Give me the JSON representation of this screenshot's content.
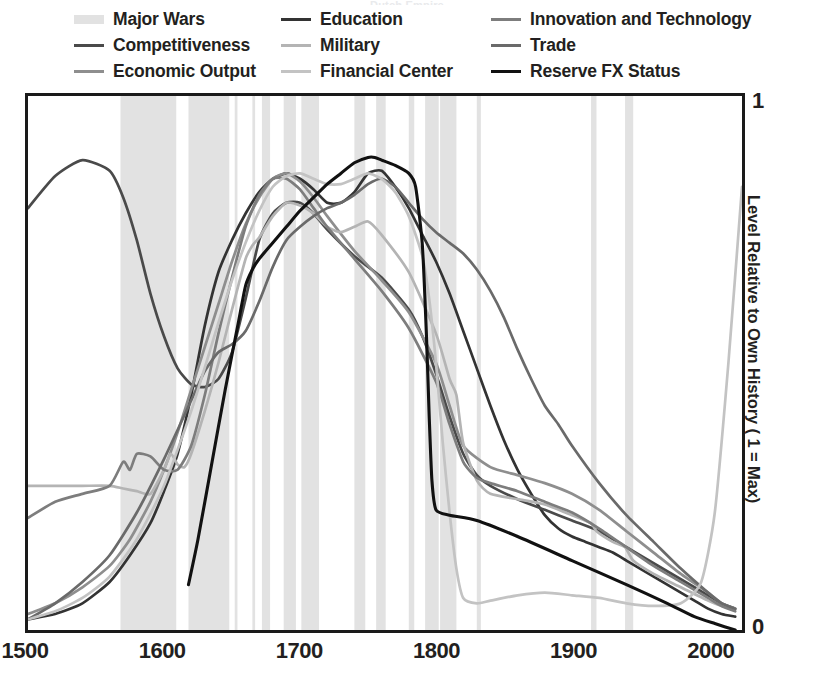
{
  "title_sliver": "Dutch Empire",
  "legend": {
    "columns": [
      {
        "items": [
          {
            "label": "Major Wars",
            "name": "major-wars",
            "color": "#e2e2e2",
            "style": "band"
          },
          {
            "label": "Competitiveness",
            "name": "competitiveness",
            "color": "#4a4a4a",
            "style": "line"
          },
          {
            "label": "Economic Output",
            "name": "economic-output",
            "color": "#8e8e8e",
            "style": "line"
          }
        ]
      },
      {
        "items": [
          {
            "label": "Education",
            "name": "education",
            "color": "#333333",
            "style": "line"
          },
          {
            "label": "Military",
            "name": "military",
            "color": "#b4b4b4",
            "style": "line"
          },
          {
            "label": "Financial Center",
            "name": "financial-center",
            "color": "#c3c3c3",
            "style": "line"
          }
        ]
      },
      {
        "items": [
          {
            "label": "Innovation and Technology",
            "name": "innovation-and-technology",
            "color": "#7d7d7d",
            "style": "line"
          },
          {
            "label": "Trade",
            "name": "trade",
            "color": "#6a6a6a",
            "style": "line"
          },
          {
            "label": "Reserve FX Status",
            "name": "reserve-fx-status",
            "color": "#111111",
            "style": "line"
          }
        ]
      }
    ]
  },
  "axes": {
    "x_ticks": [
      "1500",
      "1600",
      "1700",
      "1800",
      "1900",
      "2000"
    ],
    "y_tick_top": "1",
    "y_tick_bottom": "0",
    "y_label": "Level Relative to Own History ( 1 = Max)"
  },
  "chart_data": {
    "type": "line",
    "title": "Dutch Empire",
    "xlabel": "",
    "ylabel": "Level Relative to Own History ( 1 = Max)",
    "xlim": [
      1500,
      2025
    ],
    "ylim": [
      0,
      1
    ],
    "grid": false,
    "legend_position": "top",
    "xticks": [
      1500,
      1600,
      1700,
      1800,
      1900,
      2000
    ],
    "yticks": [
      0,
      1
    ],
    "shaded_bands": {
      "name": "Major Wars",
      "color": "#e2e2e2",
      "intervals": [
        [
          1568,
          1609
        ],
        [
          1618,
          1648
        ],
        [
          1652,
          1654
        ],
        [
          1665,
          1667
        ],
        [
          1672,
          1678
        ],
        [
          1688,
          1697
        ],
        [
          1701,
          1714
        ],
        [
          1740,
          1748
        ],
        [
          1756,
          1763
        ],
        [
          1780,
          1784
        ],
        [
          1792,
          1802
        ],
        [
          1803,
          1815
        ],
        [
          1830,
          1833
        ],
        [
          1914,
          1918
        ],
        [
          1939,
          1945
        ]
      ]
    },
    "series": [
      {
        "name": "Education",
        "color": "#333333",
        "x": [
          1500,
          1520,
          1540,
          1560,
          1575,
          1590,
          1600,
          1610,
          1620,
          1630,
          1640,
          1650,
          1660,
          1670,
          1680,
          1690,
          1700,
          1710,
          1720,
          1730,
          1740,
          1750,
          1760,
          1770,
          1780,
          1790,
          1800,
          1810,
          1820,
          1830,
          1840,
          1850,
          1860,
          1870,
          1880,
          1890,
          1900,
          1910,
          1920,
          1930,
          1940,
          1950,
          1960,
          1970,
          1980,
          1990,
          2000,
          2010,
          2020
        ],
        "y": [
          0.02,
          0.03,
          0.05,
          0.09,
          0.14,
          0.2,
          0.26,
          0.33,
          0.44,
          0.57,
          0.67,
          0.73,
          0.78,
          0.82,
          0.845,
          0.855,
          0.845,
          0.825,
          0.8,
          0.8,
          0.82,
          0.855,
          0.86,
          0.83,
          0.79,
          0.74,
          0.69,
          0.63,
          0.56,
          0.49,
          0.42,
          0.355,
          0.3,
          0.255,
          0.215,
          0.19,
          0.175,
          0.165,
          0.155,
          0.145,
          0.13,
          0.115,
          0.1,
          0.085,
          0.07,
          0.055,
          0.04,
          0.03,
          0.025
        ]
      },
      {
        "name": "Competitiveness",
        "color": "#4a4a4a",
        "x": [
          1500,
          1520,
          1540,
          1560,
          1570,
          1580,
          1590,
          1600,
          1610,
          1620,
          1630,
          1640,
          1650,
          1660,
          1670,
          1680,
          1690,
          1700,
          1710,
          1720,
          1740,
          1760,
          1780,
          1790,
          1800,
          1810,
          1820,
          1830,
          1840,
          1860,
          1880,
          1900,
          1920,
          1940,
          1960,
          1980,
          2000,
          2010,
          2020
        ],
        "y": [
          0.79,
          0.85,
          0.88,
          0.86,
          0.81,
          0.73,
          0.63,
          0.55,
          0.49,
          0.46,
          0.455,
          0.47,
          0.52,
          0.62,
          0.73,
          0.78,
          0.8,
          0.8,
          0.78,
          0.75,
          0.7,
          0.66,
          0.6,
          0.55,
          0.48,
          0.4,
          0.33,
          0.29,
          0.27,
          0.245,
          0.225,
          0.205,
          0.185,
          0.155,
          0.125,
          0.095,
          0.065,
          0.05,
          0.04
        ]
      },
      {
        "name": "Economic Output",
        "color": "#8e8e8e",
        "x": [
          1500,
          1520,
          1540,
          1560,
          1575,
          1590,
          1600,
          1610,
          1620,
          1630,
          1640,
          1650,
          1660,
          1670,
          1680,
          1690,
          1700,
          1710,
          1720,
          1740,
          1760,
          1780,
          1800,
          1810,
          1820,
          1840,
          1860,
          1880,
          1900,
          1920,
          1940,
          1960,
          1980,
          2000,
          2010,
          2020
        ],
        "y": [
          0.03,
          0.05,
          0.08,
          0.12,
          0.17,
          0.24,
          0.3,
          0.37,
          0.45,
          0.53,
          0.61,
          0.69,
          0.76,
          0.81,
          0.845,
          0.855,
          0.84,
          0.81,
          0.775,
          0.71,
          0.655,
          0.595,
          0.5,
          0.42,
          0.345,
          0.305,
          0.29,
          0.275,
          0.255,
          0.225,
          0.185,
          0.145,
          0.105,
          0.07,
          0.05,
          0.04
        ]
      },
      {
        "name": "Military",
        "color": "#b4b4b4",
        "x": [
          1500,
          1520,
          1540,
          1560,
          1570,
          1580,
          1590,
          1600,
          1605,
          1610,
          1615,
          1620,
          1630,
          1640,
          1650,
          1660,
          1665,
          1670,
          1680,
          1690,
          1700,
          1710,
          1720,
          1730,
          1740,
          1750,
          1760,
          1780,
          1800,
          1810,
          1815,
          1820,
          1830,
          1840,
          1860,
          1880,
          1900,
          1914,
          1918,
          1930,
          1939,
          1945,
          1960,
          1980,
          2000,
          2010,
          2020
        ],
        "y": [
          0.27,
          0.27,
          0.27,
          0.27,
          0.265,
          0.26,
          0.255,
          0.3,
          0.33,
          0.31,
          0.305,
          0.33,
          0.41,
          0.5,
          0.6,
          0.695,
          0.72,
          0.735,
          0.775,
          0.8,
          0.795,
          0.78,
          0.755,
          0.745,
          0.755,
          0.765,
          0.74,
          0.67,
          0.555,
          0.47,
          0.44,
          0.35,
          0.28,
          0.255,
          0.245,
          0.235,
          0.215,
          0.2,
          0.185,
          0.165,
          0.155,
          0.13,
          0.105,
          0.08,
          0.055,
          0.045,
          0.04
        ]
      },
      {
        "name": "Innovation and Technology",
        "color": "#7d7d7d",
        "x": [
          1500,
          1520,
          1540,
          1560,
          1570,
          1575,
          1580,
          1590,
          1600,
          1610,
          1620,
          1630,
          1640,
          1650,
          1660,
          1670,
          1680,
          1690,
          1700,
          1710,
          1720,
          1740,
          1760,
          1780,
          1800,
          1810,
          1820,
          1830,
          1840,
          1860,
          1880,
          1900,
          1920,
          1940,
          1960,
          1980,
          2000,
          2010,
          2020
        ],
        "y": [
          0.21,
          0.24,
          0.255,
          0.27,
          0.315,
          0.3,
          0.33,
          0.325,
          0.3,
          0.3,
          0.345,
          0.44,
          0.555,
          0.66,
          0.755,
          0.815,
          0.845,
          0.845,
          0.825,
          0.79,
          0.755,
          0.695,
          0.635,
          0.565,
          0.465,
          0.385,
          0.315,
          0.285,
          0.275,
          0.26,
          0.24,
          0.22,
          0.19,
          0.155,
          0.12,
          0.09,
          0.06,
          0.045,
          0.035
        ]
      },
      {
        "name": "Trade",
        "color": "#6a6a6a",
        "x": [
          1500,
          1520,
          1540,
          1560,
          1580,
          1600,
          1620,
          1630,
          1640,
          1650,
          1660,
          1670,
          1680,
          1690,
          1700,
          1710,
          1720,
          1730,
          1740,
          1750,
          1760,
          1770,
          1780,
          1790,
          1800,
          1810,
          1820,
          1830,
          1840,
          1850,
          1860,
          1870,
          1880,
          1890,
          1900,
          1920,
          1940,
          1960,
          1980,
          2000,
          2010,
          2020
        ],
        "y": [
          0.02,
          0.05,
          0.09,
          0.14,
          0.22,
          0.32,
          0.43,
          0.485,
          0.52,
          0.535,
          0.56,
          0.615,
          0.68,
          0.73,
          0.755,
          0.775,
          0.79,
          0.8,
          0.815,
          0.835,
          0.845,
          0.83,
          0.8,
          0.77,
          0.745,
          0.725,
          0.705,
          0.675,
          0.635,
          0.585,
          0.525,
          0.47,
          0.42,
          0.385,
          0.345,
          0.275,
          0.215,
          0.165,
          0.115,
          0.07,
          0.05,
          0.04
        ]
      },
      {
        "name": "Financial Center",
        "color": "#c3c3c3",
        "x": [
          1500,
          1520,
          1540,
          1560,
          1580,
          1600,
          1620,
          1640,
          1650,
          1660,
          1670,
          1680,
          1690,
          1700,
          1710,
          1720,
          1730,
          1740,
          1750,
          1760,
          1770,
          1780,
          1790,
          1795,
          1800,
          1805,
          1810,
          1815,
          1820,
          1830,
          1840,
          1860,
          1880,
          1900,
          1920,
          1940,
          1960,
          1980,
          1995,
          2005,
          2015,
          2025
        ],
        "y": [
          0.02,
          0.035,
          0.06,
          0.1,
          0.17,
          0.27,
          0.41,
          0.575,
          0.655,
          0.725,
          0.785,
          0.83,
          0.85,
          0.855,
          0.845,
          0.835,
          0.835,
          0.845,
          0.855,
          0.845,
          0.82,
          0.775,
          0.7,
          0.62,
          0.5,
          0.35,
          0.22,
          0.115,
          0.06,
          0.05,
          0.055,
          0.065,
          0.07,
          0.065,
          0.06,
          0.05,
          0.045,
          0.05,
          0.09,
          0.22,
          0.5,
          0.83
        ]
      },
      {
        "name": "Reserve FX Status",
        "color": "#111111",
        "x": [
          1618,
          1625,
          1635,
          1645,
          1655,
          1660,
          1665,
          1670,
          1680,
          1690,
          1700,
          1710,
          1720,
          1730,
          1740,
          1750,
          1755,
          1760,
          1770,
          1780,
          1785,
          1790,
          1793,
          1795,
          1797,
          1800,
          1810,
          1830,
          1860,
          1900,
          1940,
          1970,
          1990,
          2005,
          2020
        ],
        "y": [
          0.085,
          0.17,
          0.31,
          0.45,
          0.58,
          0.645,
          0.675,
          0.695,
          0.725,
          0.755,
          0.785,
          0.81,
          0.835,
          0.855,
          0.875,
          0.885,
          0.885,
          0.88,
          0.87,
          0.855,
          0.83,
          0.72,
          0.55,
          0.4,
          0.28,
          0.225,
          0.215,
          0.205,
          0.175,
          0.13,
          0.085,
          0.05,
          0.025,
          0.012,
          0.0
        ]
      }
    ]
  }
}
